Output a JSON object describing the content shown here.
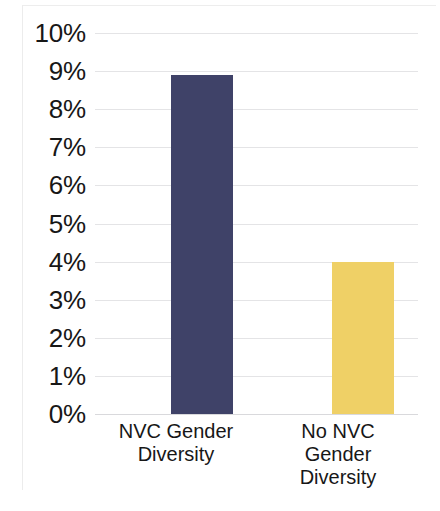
{
  "chart_data": {
    "type": "bar",
    "title": "",
    "subtitle": "",
    "xlabel": "",
    "ylabel": "",
    "categories": [
      "NVC Gender Diversity",
      "No NVC Gender Diversity"
    ],
    "category_lines": [
      [
        "NVC Gender",
        "Diversity"
      ],
      [
        "No NVC",
        "Gender",
        "Diversity"
      ]
    ],
    "values": [
      8.9,
      4.0
    ],
    "value_labels": [
      "8.9%",
      "4.0%"
    ],
    "bar_colors": [
      "#3f4268",
      "#efd066"
    ],
    "ylim": [
      0,
      10
    ],
    "ytick_values": [
      10,
      9,
      8,
      7,
      6,
      5,
      4,
      3,
      2,
      1,
      0
    ],
    "ytick_labels": [
      "10%",
      "9%",
      "8%",
      "7%",
      "6%",
      "5%",
      "4%",
      "3%",
      "2%",
      "1%",
      "0%"
    ],
    "grid": true,
    "grid_axis": "y",
    "grid_color": "#e4e4e6",
    "legend": false,
    "legend_position": "none",
    "background_color": "#ffffff"
  }
}
